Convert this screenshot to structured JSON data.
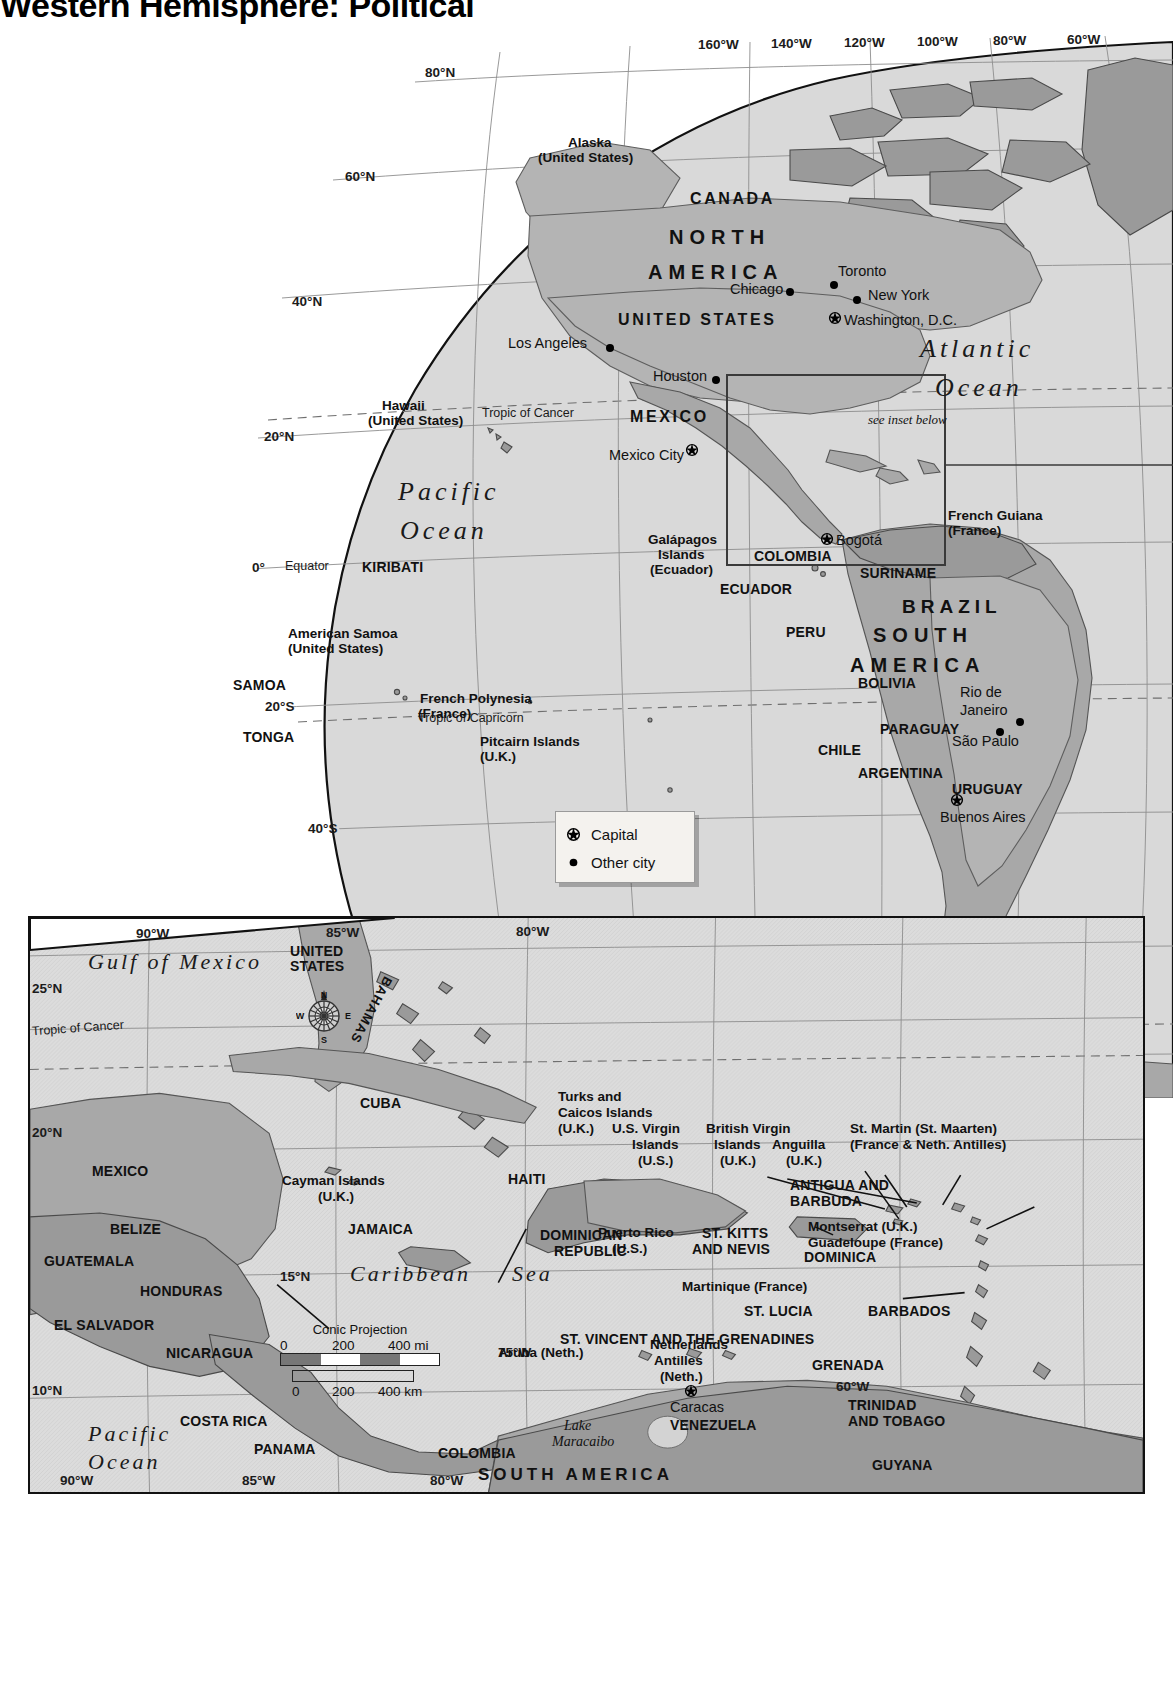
{
  "title": "Western Hemisphere: Political",
  "main_map": {
    "name": "western-hemisphere-globe",
    "projection_note": "see inset below",
    "oceans": [
      {
        "label": "Pacific\nOcean",
        "line1": "Pacific",
        "line2": "Ocean"
      },
      {
        "label": "Atlantic\nOcean",
        "line1": "Atlantic",
        "line2": "Ocean"
      },
      {
        "label": "Southern Ocean"
      }
    ],
    "ocean_atlantic_l1": "Atlantic",
    "ocean_atlantic_l2": "Ocean",
    "ocean_pacific_l1": "Pacific",
    "ocean_pacific_l2": "Ocean",
    "ocean_southern": "Southern  Ocean",
    "continents": {
      "north_america_l1": "NORTH",
      "north_america_l2": "AMERICA",
      "south_america_l1": "SOUTH",
      "south_america_l2": "AMERICA"
    },
    "countries": [
      "CANADA",
      "UNITED STATES",
      "MEXICO",
      "KIRIBATI",
      "SAMOA",
      "TONGA",
      "COLOMBIA",
      "ECUADOR",
      "SURINAME",
      "BRAZIL",
      "PERU",
      "BOLIVIA",
      "PARAGUAY",
      "CHILE",
      "ARGENTINA",
      "URUGUAY"
    ],
    "country_canada": "CANADA",
    "country_united_states": "UNITED STATES",
    "country_mexico": "MEXICO",
    "country_kiribati": "KIRIBATI",
    "country_samoa": "SAMOA",
    "country_tonga": "TONGA",
    "country_colombia": "COLOMBIA",
    "country_ecuador": "ECUADOR",
    "country_suriname": "SURINAME",
    "country_brazil": "BRAZIL",
    "country_peru": "PERU",
    "country_bolivia": "BOLIVIA",
    "country_paraguay": "PARAGUAY",
    "country_chile": "CHILE",
    "country_argentina": "ARGENTINA",
    "country_uruguay": "URUGUAY",
    "territories": {
      "alaska_l1": "Alaska",
      "alaska_l2": "(United States)",
      "hawaii_l1": "Hawaii",
      "hawaii_l2": "(United States)",
      "american_samoa_l1": "American Samoa",
      "american_samoa_l2": "(United States)",
      "french_polynesia_l1": "French Polynesia",
      "french_polynesia_l2": "(France)",
      "pitcairn_l1": "Pitcairn Islands",
      "pitcairn_l2": "(U.K.)",
      "galapagos_l1": "Galápagos",
      "galapagos_l2": "Islands",
      "galapagos_l3": "(Ecuador)",
      "french_guiana_l1": "French Guiana",
      "french_guiana_l2": "(France)"
    },
    "cities": [
      {
        "name": "Toronto",
        "type": "other"
      },
      {
        "name": "Chicago",
        "type": "other"
      },
      {
        "name": "New York",
        "type": "other"
      },
      {
        "name": "Washington, D.C.",
        "type": "capital"
      },
      {
        "name": "Los Angeles",
        "type": "other"
      },
      {
        "name": "Houston",
        "type": "other"
      },
      {
        "name": "Mexico City",
        "type": "capital"
      },
      {
        "name": "Bogotá",
        "type": "capital"
      },
      {
        "name": "Rio de Janeiro",
        "type": "other"
      },
      {
        "name": "São Paulo",
        "type": "other"
      },
      {
        "name": "Buenos Aires",
        "type": "capital"
      }
    ],
    "city_toronto": "Toronto",
    "city_chicago": "Chicago",
    "city_new_york": "New York",
    "city_washington": "Washington, D.C.",
    "city_los_angeles": "Los Angeles",
    "city_houston": "Houston",
    "city_mexico_city": "Mexico City",
    "city_bogota": "Bogotá",
    "city_rio_l1": "Rio de",
    "city_rio_l2": "Janeiro",
    "city_sao_paulo": "São Paulo",
    "city_buenos_aires": "Buenos Aires",
    "reference_lines": {
      "equator": "Equator",
      "tropic_of_cancer": "Tropic of Cancer",
      "tropic_of_capricorn": "Tropic of Capricorn",
      "antarctic_circle": "Antarctic Circle"
    },
    "longitude_top": [
      "160°W",
      "140°W",
      "120°W",
      "100°W",
      "80°W",
      "60°W"
    ],
    "longitude_bottom": [
      "160°W",
      "140°W",
      "120°W",
      "100°W",
      "80°W",
      "60°W",
      "40°W"
    ],
    "latitude_labels": [
      "80°N",
      "60°N",
      "40°N",
      "20°N",
      "0°",
      "20°S",
      "40°S",
      "60°S",
      "80°S"
    ]
  },
  "legend": {
    "name": "map-legend",
    "items": [
      {
        "symbol": "capital-star-icon",
        "label": "Capital"
      },
      {
        "symbol": "city-dot-icon",
        "label": "Other city"
      }
    ],
    "capital_label": "Capital",
    "other_city_label": "Other city"
  },
  "inset": {
    "name": "caribbean-inset-map",
    "water_labels": {
      "gulf_of_mexico": "Gulf of Mexico",
      "caribbean_sea_l1": "Caribbean",
      "caribbean_sea_l2": "Sea",
      "pacific_l1": "Pacific",
      "pacific_l2": "Ocean",
      "lake_maracaibo_l1": "Lake",
      "lake_maracaibo_l2": "Maracaibo"
    },
    "reference_lines": {
      "tropic_of_cancer": "Tropic of Cancer"
    },
    "longitude_top": [
      "90°W",
      "85°W",
      "80°W"
    ],
    "longitude_bottom": [
      "90°W",
      "85°W",
      "80°W"
    ],
    "longitude_other": [
      "75°W",
      "60°W"
    ],
    "latitude_labels": [
      "25°N",
      "20°N",
      "15°N",
      "10°N"
    ],
    "countries": [
      "UNITED STATES",
      "BAHAMAS",
      "CUBA",
      "MEXICO",
      "BELIZE",
      "GUATEMALA",
      "HONDURAS",
      "EL SALVADOR",
      "NICARAGUA",
      "COSTA RICA",
      "PANAMA",
      "JAMAICA",
      "HAITI",
      "DOMINICAN REPUBLIC",
      "ST. KITTS AND NEVIS",
      "ANTIGUA AND BARBUDA",
      "DOMINICA",
      "ST. LUCIA",
      "ST. VINCENT AND THE GRENADINES",
      "BARBADOS",
      "GRENADA",
      "TRINIDAD AND TOBAGO",
      "VENEZUELA",
      "COLOMBIA",
      "GUYANA",
      "SOUTH AMERICA"
    ],
    "c_united_states_l1": "UNITED",
    "c_united_states_l2": "STATES",
    "c_bahamas": "BAHAMAS",
    "c_cuba": "CUBA",
    "c_mexico": "MEXICO",
    "c_belize": "BELIZE",
    "c_guatemala": "GUATEMALA",
    "c_honduras": "HONDURAS",
    "c_el_salvador": "EL SALVADOR",
    "c_nicaragua": "NICARAGUA",
    "c_costa_rica": "COSTA RICA",
    "c_panama": "PANAMA",
    "c_jamaica": "JAMAICA",
    "c_haiti": "HAITI",
    "c_dominican_l1": "DOMINICAN",
    "c_dominican_l2": "REPUBLIC",
    "c_st_kitts_l1": "ST. KITTS",
    "c_st_kitts_l2": "AND NEVIS",
    "c_antigua_l1": "ANTIGUA AND",
    "c_antigua_l2": "BARBUDA",
    "c_dominica": "DOMINICA",
    "c_st_lucia": "ST. LUCIA",
    "c_st_vincent": "ST. VINCENT AND THE GRENADINES",
    "c_barbados": "BARBADOS",
    "c_grenada": "GRENADA",
    "c_trinidad_l1": "TRINIDAD",
    "c_trinidad_l2": "AND TOBAGO",
    "c_venezuela": "VENEZUELA",
    "c_colombia": "COLOMBIA",
    "c_guyana": "GUYANA",
    "c_south_america": "SOUTH AMERICA",
    "territories": {
      "turks_l1": "Turks and",
      "turks_l2": "Caicos Islands",
      "turks_l3": "(U.K.)",
      "usvi_l1": "U.S. Virgin",
      "usvi_l2": "Islands",
      "usvi_l3": "(U.S.)",
      "bvi_l1": "British Virgin",
      "bvi_l2": "Islands",
      "bvi_l3": "(U.K.)",
      "anguilla_l1": "Anguilla",
      "anguilla_l2": "(U.K.)",
      "st_martin_l1": "St. Martin (St. Maarten)",
      "st_martin_l2": "(France & Neth. Antilles)",
      "cayman_l1": "Cayman Islands",
      "cayman_l2": "(U.K.)",
      "puerto_rico_l1": "Puerto Rico",
      "puerto_rico_l2": "(U.S.)",
      "montserrat": "Montserrat (U.K.)",
      "guadeloupe": "Guadeloupe (France)",
      "martinique": "Martinique (France)",
      "aruba": "Aruba (Neth.)",
      "neth_antilles_l1": "Netherlands",
      "neth_antilles_l2": "Antilles",
      "neth_antilles_l3": "(Neth.)"
    },
    "cities": [
      {
        "name": "Caracas",
        "type": "capital"
      }
    ],
    "city_caracas": "Caracas",
    "scale": {
      "projection": "Conic Projection",
      "miles": [
        "0",
        "200",
        "400 mi"
      ],
      "km": [
        "0",
        "200",
        "400 km"
      ]
    },
    "compass": {
      "n": "N",
      "s": "S",
      "e": "E",
      "w": "W"
    }
  },
  "colors": {
    "ocean": "#d9d9d9",
    "land": "#b4b4b4",
    "land_dark": "#9a9a9a",
    "outline": "#111111",
    "graticule": "#8d8d8d"
  }
}
